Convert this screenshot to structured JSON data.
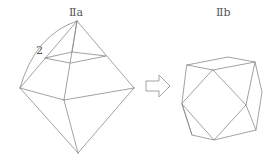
{
  "figure": {
    "left": {
      "title": "Ⅱa",
      "edge_label": "2",
      "description": "octahedron with truncation plane near apex"
    },
    "arrow": {
      "icon": "right-arrow-icon",
      "direction": "right"
    },
    "right": {
      "title": "Ⅱb",
      "description": "cuboctahedron-like polyhedron"
    }
  },
  "colors": {
    "line": "#8a8a8a",
    "text": "#555555",
    "background": "#ffffff"
  }
}
